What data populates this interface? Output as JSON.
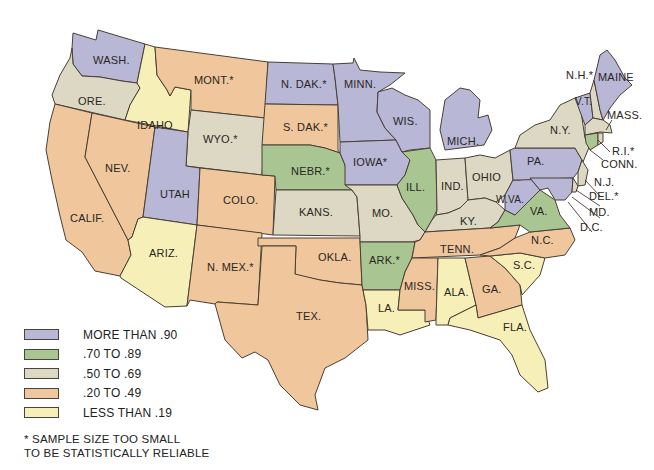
{
  "map": {
    "type": "choropleth",
    "region": "United States",
    "colors": {
      "more_than_90": "#b8b7d6",
      "70_to_89": "#a9c592",
      "50_to_69": "#dcd8c3",
      "20_to_49": "#f0c79c",
      "less_than_19": "#f6efb8"
    },
    "states": [
      {
        "label": "WASH.",
        "category": "more_than_90"
      },
      {
        "label": "ORE.",
        "category": "50_to_69"
      },
      {
        "label": "CALIF.",
        "category": "20_to_49"
      },
      {
        "label": "NEV.",
        "category": "20_to_49"
      },
      {
        "label": "IDAHO",
        "category": "less_than_19"
      },
      {
        "label": "MONT.*",
        "category": "20_to_49"
      },
      {
        "label": "WYO.*",
        "category": "50_to_69"
      },
      {
        "label": "UTAH",
        "category": "more_than_90"
      },
      {
        "label": "ARIZ.",
        "category": "less_than_19"
      },
      {
        "label": "COLO.",
        "category": "20_to_49"
      },
      {
        "label": "N. MEX.*",
        "category": "20_to_49"
      },
      {
        "label": "N. DAK.*",
        "category": "more_than_90"
      },
      {
        "label": "S. DAK.*",
        "category": "20_to_49"
      },
      {
        "label": "NEBR.*",
        "category": "70_to_89"
      },
      {
        "label": "KANS.",
        "category": "50_to_69"
      },
      {
        "label": "OKLA.",
        "category": "20_to_49"
      },
      {
        "label": "TEX.",
        "category": "20_to_49"
      },
      {
        "label": "MINN.",
        "category": "more_than_90"
      },
      {
        "label": "IOWA*",
        "category": "more_than_90"
      },
      {
        "label": "MO.",
        "category": "50_to_69"
      },
      {
        "label": "ARK.*",
        "category": "70_to_89"
      },
      {
        "label": "LA.",
        "category": "less_than_19"
      },
      {
        "label": "WIS.",
        "category": "more_than_90"
      },
      {
        "label": "ILL.",
        "category": "70_to_89"
      },
      {
        "label": "MICH.",
        "category": "more_than_90"
      },
      {
        "label": "IND.",
        "category": "50_to_69"
      },
      {
        "label": "OHIO",
        "category": "50_to_69"
      },
      {
        "label": "KY.",
        "category": "50_to_69"
      },
      {
        "label": "TENN.",
        "category": "20_to_49"
      },
      {
        "label": "MISS.",
        "category": "20_to_49"
      },
      {
        "label": "ALA.",
        "category": "less_than_19"
      },
      {
        "label": "GA.",
        "category": "20_to_49"
      },
      {
        "label": "FLA.",
        "category": "less_than_19"
      },
      {
        "label": "S.C.",
        "category": "less_than_19"
      },
      {
        "label": "N.C.",
        "category": "20_to_49"
      },
      {
        "label": "VA.",
        "category": "70_to_89"
      },
      {
        "label": "W.VA.",
        "category": "more_than_90"
      },
      {
        "label": "PA.",
        "category": "more_than_90"
      },
      {
        "label": "N.Y.",
        "category": "50_to_69"
      },
      {
        "label": "V.T.",
        "category": "more_than_90"
      },
      {
        "label": "N.H.*",
        "category": "50_to_69"
      },
      {
        "label": "MAINE",
        "category": "more_than_90"
      },
      {
        "label": "MASS.",
        "category": "50_to_69"
      },
      {
        "label": "R.I.*",
        "category": "50_to_69"
      },
      {
        "label": "CONN.",
        "category": "70_to_89"
      },
      {
        "label": "N.J.",
        "category": "50_to_69"
      },
      {
        "label": "DEL.*",
        "category": "50_to_69"
      },
      {
        "label": "MD.",
        "category": "more_than_90"
      },
      {
        "label": "D.C.",
        "category": "more_than_90"
      }
    ]
  },
  "legend": {
    "items": [
      {
        "label": "MORE THAN .90",
        "color": "#b8b7d6"
      },
      {
        "label": ".70 TO .89",
        "color": "#a9c592"
      },
      {
        "label": ".50 TO .69",
        "color": "#dcd8c3"
      },
      {
        "label": ".20 TO .49",
        "color": "#f0c79c"
      },
      {
        "label": "LESS THAN .19",
        "color": "#f6efb8"
      }
    ],
    "note_line1": "* SAMPLE SIZE TOO SMALL",
    "note_line2": "TO BE STATISTICALLY RELIABLE"
  }
}
